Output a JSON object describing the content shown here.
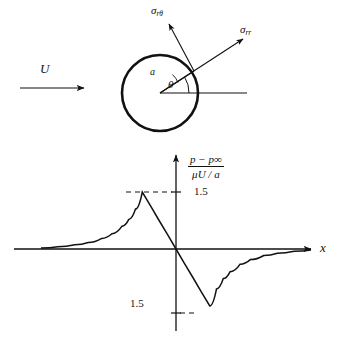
{
  "figure": {
    "title": "",
    "background_color": "#ffffff",
    "line_color": "#111111",
    "labels": {
      "free_stream_velocity": "U",
      "stress_shear": "σ",
      "stress_shear_sub": "rθ",
      "stress_normal": "σ",
      "stress_normal_sub": "rr",
      "radius": "a",
      "angle": "θ",
      "x_axis": "x",
      "y_axis_numerator": "p − p∞",
      "y_axis_denominator": "μU / a",
      "tick_positive": "1.5",
      "tick_negative": "1.5"
    },
    "sphere": {
      "center_x": 160,
      "center_y": 93,
      "radius": 38
    }
  },
  "chart_data": {
    "type": "line",
    "title": "",
    "xlabel": "x",
    "ylabel": "(p − p∞) / (μU / a)",
    "grid": false,
    "legend": null,
    "xlim": [
      -4,
      4
    ],
    "ylim": [
      -1.8,
      1.8
    ],
    "yticks": [
      1.5,
      -1.5
    ],
    "ytick_labels": [
      "1.5",
      "1.5"
    ],
    "annotations": [
      {
        "text": "1.5",
        "x": 0,
        "y": 1.5,
        "note": "dashed leader from peak to y-axis"
      },
      {
        "text": "1.5",
        "x": 0,
        "y": -1.5,
        "note": "dashed leader from trough to y-axis"
      }
    ],
    "series": [
      {
        "name": "pressure perturbation",
        "comment": "antisymmetric: slow decay to zero at far left, rising to peak +1.5 at x=-1, linear fall through origin to -1.5 at x=+1, then slow decay to zero at far right",
        "x": [
          -4.0,
          -3.5,
          -3.0,
          -2.6,
          -2.2,
          -1.9,
          -1.6,
          -1.4,
          -1.2,
          -1.0,
          -0.75,
          -0.5,
          -0.25,
          0.0,
          0.25,
          0.5,
          0.75,
          1.0,
          1.2,
          1.4,
          1.6,
          1.9,
          2.2,
          2.6,
          3.0,
          3.5,
          4.0
        ],
        "y": [
          0.03,
          0.06,
          0.11,
          0.17,
          0.28,
          0.4,
          0.6,
          0.78,
          1.05,
          1.5,
          1.13,
          0.75,
          0.38,
          0.0,
          -0.38,
          -0.75,
          -1.13,
          -1.5,
          -1.05,
          -0.78,
          -0.6,
          -0.4,
          -0.28,
          -0.17,
          -0.11,
          -0.06,
          -0.03
        ]
      }
    ]
  }
}
